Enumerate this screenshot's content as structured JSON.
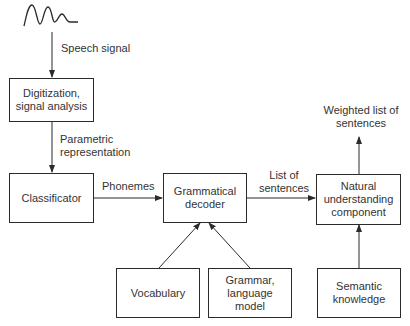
{
  "diagram": {
    "nodes": {
      "digitization": "Digitization,\nsignal analysis",
      "classificator": "Classificator",
      "grammatical_decoder": "Grammatical\ndecoder",
      "natural_understanding": "Natural\nunderstanding\ncomponent",
      "vocabulary": "Vocabulary",
      "grammar": "Grammar,\nlanguage\nmodel",
      "semantic": "Semantic\nknowledge"
    },
    "edges": {
      "speech_signal": "Speech signal",
      "parametric_representation": "Parametric\nrepresentation",
      "phonemes": "Phonemes",
      "list_of_sentences": "List of\nsentences",
      "weighted_list": "Weighted list of\nsentences"
    },
    "icons": {
      "input": "speech-waveform-icon"
    },
    "colors": {
      "line": "#2b2b2b",
      "text": "#333333",
      "background": "#ffffff"
    }
  }
}
